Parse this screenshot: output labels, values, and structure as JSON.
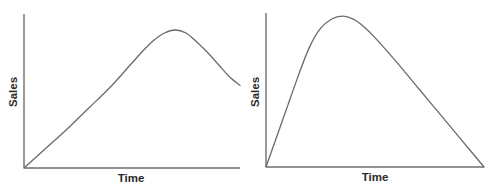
{
  "chart_data": [
    {
      "type": "line",
      "title": "",
      "xlabel": "Time",
      "ylabel": "Sales",
      "grid": false,
      "legend": null,
      "ticks": false,
      "description": "Sales rise steadily, peak at around 70% of the timeline, then decline",
      "xlim": [
        0,
        100
      ],
      "ylim": [
        0,
        100
      ],
      "x": [
        0,
        10,
        20,
        30,
        40,
        50,
        55,
        60,
        65,
        70,
        75,
        80,
        85,
        90,
        95,
        100
      ],
      "values": [
        0,
        13,
        26,
        40,
        54,
        70,
        78,
        85,
        90,
        92,
        90,
        84,
        77,
        69,
        61,
        55
      ]
    },
    {
      "type": "line",
      "title": "",
      "xlabel": "Time",
      "ylabel": "Sales",
      "grid": false,
      "legend": null,
      "ticks": false,
      "description": "Sales rise sharply, peak early at around 40% of the timeline, then decline steadily back to zero",
      "xlim": [
        0,
        100
      ],
      "ylim": [
        0,
        100
      ],
      "x": [
        0,
        5,
        10,
        15,
        20,
        25,
        30,
        35,
        40,
        45,
        50,
        60,
        70,
        80,
        90,
        100
      ],
      "values": [
        0,
        20,
        40,
        60,
        78,
        90,
        96,
        98,
        96,
        91,
        84,
        68,
        51,
        34,
        17,
        0
      ]
    }
  ],
  "charts": [
    {
      "xlabel": "Time",
      "ylabel": "Sales"
    },
    {
      "xlabel": "Time",
      "ylabel": "Sales"
    }
  ]
}
